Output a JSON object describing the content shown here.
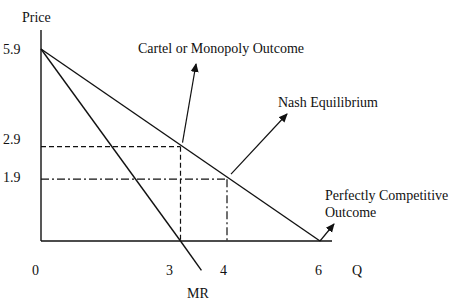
{
  "chart_data": {
    "type": "line",
    "title": "",
    "xlabel": "Q",
    "ylabel": "Price",
    "x_ticks": [
      "0",
      "3",
      "4",
      "6"
    ],
    "y_ticks": [
      "5.9",
      "2.9",
      "1.9"
    ],
    "series": [
      {
        "name": "Demand",
        "points": [
          [
            0,
            5.9
          ],
          [
            6,
            0
          ]
        ]
      },
      {
        "name": "MR",
        "points": [
          [
            0,
            5.9
          ],
          [
            3,
            0
          ],
          [
            3.45,
            -0.9
          ]
        ]
      }
    ],
    "reference_lines": [
      {
        "name": "monopoly-price",
        "style": "dashed",
        "from": [
          0,
          2.9
        ],
        "to": [
          3,
          2.9
        ]
      },
      {
        "name": "monopoly-quantity",
        "style": "dashed",
        "from": [
          3,
          2.9
        ],
        "to": [
          3,
          0
        ]
      },
      {
        "name": "nash-price",
        "style": "dash-dot",
        "from": [
          0,
          1.9
        ],
        "to": [
          4,
          1.9
        ]
      },
      {
        "name": "nash-quantity",
        "style": "dash-dot",
        "from": [
          4,
          1.9
        ],
        "to": [
          4,
          0
        ]
      }
    ],
    "annotations": [
      {
        "text": "Cartel or Monopoly Outcome",
        "point": [
          3,
          2.9
        ]
      },
      {
        "text": "Nash Equilibrium",
        "point": [
          4,
          1.9
        ]
      },
      {
        "text": "Perfectly Competitive Outcome",
        "lines": [
          "Perfectly Competitive",
          "Outcome"
        ],
        "point": [
          6,
          0
        ]
      },
      {
        "text": "MR",
        "point": [
          3.45,
          -0.9
        ]
      }
    ],
    "xlim": [
      0,
      6.6
    ],
    "ylim": [
      0,
      5.9
    ]
  }
}
